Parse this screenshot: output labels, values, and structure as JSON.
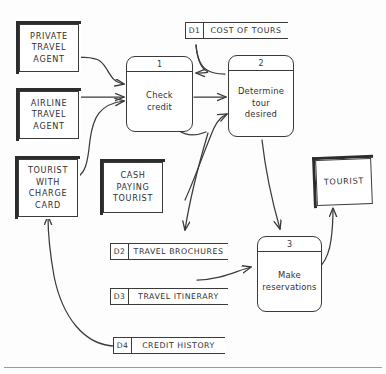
{
  "diagram": {
    "type": "data-flow-diagram",
    "stroke_color": "#3a3a3a",
    "background_color": "#fdfdfd"
  },
  "entities": [
    {
      "id": "private-travel-agent",
      "label": "PRIVATE\nTRAVEL\nAGENT"
    },
    {
      "id": "airline-travel-agent",
      "label": "AIRLINE\nTRAVEL\nAGENT"
    },
    {
      "id": "tourist-with-charge-card",
      "label": "TOURIST\nWITH\nCHARGE\nCARD"
    },
    {
      "id": "cash-paying-tourist",
      "label": "CASH\nPAYING\nTOURIST"
    },
    {
      "id": "tourist",
      "label": "TOURIST"
    }
  ],
  "processes": [
    {
      "number": "1",
      "name": "Check\ncredit"
    },
    {
      "number": "2",
      "name": "Determine\ntour\ndesired"
    },
    {
      "number": "3",
      "name": "Make\nreservations"
    }
  ],
  "datastores": [
    {
      "id": "D1",
      "name": "COST OF TOURS"
    },
    {
      "id": "D2",
      "name": "TRAVEL BROCHURES"
    },
    {
      "id": "D3",
      "name": "TRAVEL ITINERARY"
    },
    {
      "id": "D4",
      "name": "CREDIT HISTORY"
    }
  ],
  "flows": [
    {
      "from": "private-travel-agent",
      "to": "process-1"
    },
    {
      "from": "airline-travel-agent",
      "to": "process-1"
    },
    {
      "from": "tourist-with-charge-card",
      "to": "process-1"
    },
    {
      "from": "process-1",
      "to": "process-2"
    },
    {
      "from": "D1",
      "to": "process-1"
    },
    {
      "from": "cash-paying-tourist",
      "to": "process-2"
    },
    {
      "from": "process-2",
      "to": "D2"
    },
    {
      "from": "process-2",
      "to": "process-3"
    },
    {
      "from": "D3",
      "to": "process-3"
    },
    {
      "from": "process-3",
      "to": "tourist"
    },
    {
      "from": "D4",
      "to": "tourist-with-charge-card"
    }
  ]
}
